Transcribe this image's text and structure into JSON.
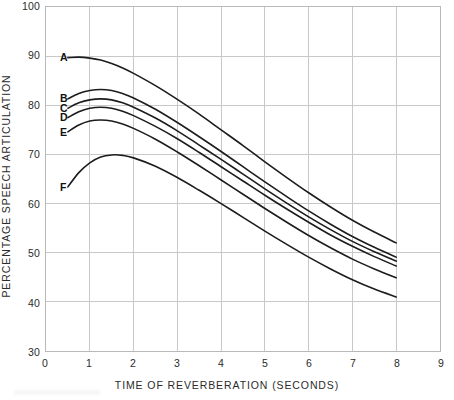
{
  "chart_data": {
    "type": "line",
    "title": "",
    "xlabel": "TIME OF REVERBERATION (SECONDS)",
    "ylabel": "PERCENTAGE SPEECH ARTICULATION",
    "xlim": [
      0,
      9
    ],
    "ylim": [
      30,
      100
    ],
    "xticks": [
      0,
      1,
      2,
      3,
      4,
      5,
      6,
      7,
      8,
      9
    ],
    "xtick_labels": [
      "0",
      "1",
      "2",
      "3",
      "4",
      "5",
      "6",
      "7",
      "8",
      "9"
    ],
    "yticks": [
      30,
      40,
      50,
      60,
      70,
      80,
      90,
      100
    ],
    "ytick_labels": [
      "30",
      "40",
      "50",
      "60",
      "70",
      "80",
      "90",
      "100"
    ],
    "grid": true,
    "legend_position": "inline-left-labels",
    "line_color": "#1c1c1c",
    "grid_color": "#c8c8c8",
    "axis_color": "#b9b9b9",
    "x": [
      0.5,
      0.75,
      1.0,
      1.25,
      1.5,
      1.75,
      2.0,
      2.5,
      3.0,
      3.5,
      4.0,
      4.5,
      5.0,
      5.5,
      6.0,
      6.5,
      7.0,
      7.5,
      8.0
    ],
    "series": [
      {
        "name": "A",
        "label": "A",
        "values": [
          89.7,
          89.8,
          89.6,
          89.2,
          88.5,
          87.6,
          86.5,
          84.0,
          81.2,
          78.2,
          75.0,
          71.8,
          68.5,
          65.3,
          62.2,
          59.3,
          56.6,
          54.2,
          52.0
        ],
        "label_x": 0.43,
        "label_y": 89.7
      },
      {
        "name": "B",
        "label": "B",
        "values": [
          81.3,
          82.4,
          83.0,
          83.2,
          83.0,
          82.4,
          81.5,
          79.2,
          76.5,
          73.6,
          70.6,
          67.5,
          64.4,
          61.4,
          58.5,
          55.8,
          53.3,
          51.1,
          49.1
        ],
        "label_x": 0.43,
        "label_y": 81.3
      },
      {
        "name": "C",
        "label": "C",
        "values": [
          79.4,
          80.5,
          81.1,
          81.3,
          81.1,
          80.5,
          79.6,
          77.4,
          74.8,
          71.9,
          69.0,
          66.0,
          63.0,
          60.1,
          57.3,
          54.7,
          52.3,
          50.2,
          48.3
        ],
        "label_x": 0.43,
        "label_y": 79.4
      },
      {
        "name": "D",
        "label": "D",
        "values": [
          77.5,
          78.7,
          79.4,
          79.6,
          79.4,
          78.8,
          77.9,
          75.7,
          73.2,
          70.4,
          67.5,
          64.6,
          61.7,
          58.9,
          56.2,
          53.6,
          51.3,
          49.2,
          47.3
        ],
        "label_x": 0.43,
        "label_y": 77.5
      },
      {
        "name": "E",
        "label": "E",
        "values": [
          74.6,
          76.0,
          76.8,
          77.0,
          76.8,
          76.2,
          75.3,
          73.1,
          70.5,
          67.7,
          64.8,
          61.9,
          59.0,
          56.2,
          53.5,
          51.0,
          48.7,
          46.7,
          44.9
        ],
        "label_x": 0.43,
        "label_y": 74.6
      },
      {
        "name": "F",
        "label": "F",
        "values": [
          63.4,
          66.3,
          68.3,
          69.5,
          69.9,
          69.8,
          69.3,
          67.6,
          65.3,
          62.7,
          60.0,
          57.2,
          54.4,
          51.7,
          49.1,
          46.7,
          44.5,
          42.6,
          41.0
        ],
        "label_x": 0.43,
        "label_y": 63.4
      }
    ]
  }
}
